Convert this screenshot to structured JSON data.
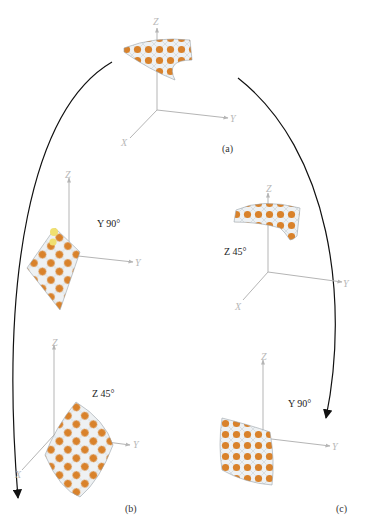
{
  "figure": {
    "panels": [
      {
        "id": "a",
        "label": "(a)",
        "rotation": "",
        "axes": {
          "x": "X",
          "y": "Y",
          "z": "Z"
        }
      },
      {
        "id": "b1",
        "label": "",
        "rotation": "Y 90°",
        "axes": {
          "x": "",
          "y": "Y",
          "z": "Z"
        }
      },
      {
        "id": "b2",
        "label": "(b)",
        "rotation": "Z 45°",
        "axes": {
          "x": "X",
          "y": "Y",
          "z": "Z"
        }
      },
      {
        "id": "c1",
        "label": "",
        "rotation": "Z 45°",
        "axes": {
          "x": "X",
          "y": "Y",
          "z": "Z"
        }
      },
      {
        "id": "c2",
        "label": "(c)",
        "rotation": "Y 90°",
        "axes": {
          "x": "",
          "y": "Y",
          "z": "Z"
        }
      }
    ],
    "colors": {
      "dot": "#d9822b",
      "mesh": "#c8d0d6",
      "axis": "#b5b5b5",
      "arrow": "#111111",
      "highlight_dot": "#f0e070"
    }
  }
}
